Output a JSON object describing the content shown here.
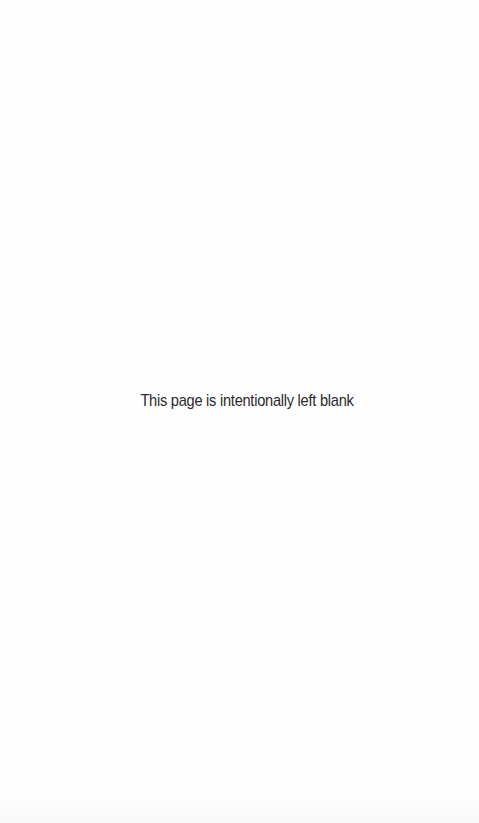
{
  "page": {
    "notice_text": "This page is intentionally left blank"
  }
}
